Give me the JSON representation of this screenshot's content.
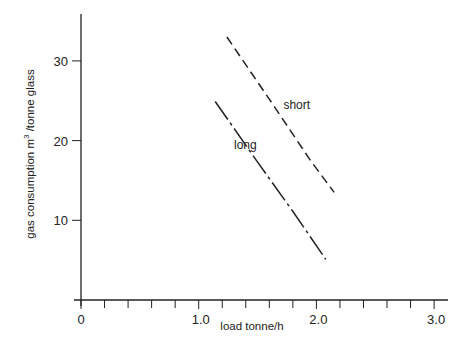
{
  "chart_data": {
    "type": "line",
    "title": "",
    "xlabel": "load  tonne/h",
    "ylabel": "gas consumption m³/tonne glass",
    "ylabel_main": "gas consumption m",
    "ylabel_sup": "3",
    "ylabel_rest": " /tonne glass",
    "xlim": [
      0,
      3.0
    ],
    "ylim": [
      0,
      35
    ],
    "x_ticks": [
      0,
      1.0,
      2.0,
      3.0
    ],
    "x_tick_labels": [
      "0",
      "1.0",
      "2.0",
      "3.0"
    ],
    "x_minor_tick_step": 0.2,
    "y_ticks": [
      10,
      20,
      30
    ],
    "y_tick_labels": [
      "10",
      "20",
      "30"
    ],
    "grid": false,
    "legend": "inline labels",
    "series": [
      {
        "name": "short",
        "style": "dashed",
        "x": [
          1.24,
          1.6,
          1.95,
          2.15
        ],
        "y": [
          33.0,
          25.2,
          17.5,
          13.5
        ]
      },
      {
        "name": "long",
        "style": "dash-dot",
        "x": [
          1.14,
          1.5,
          1.8,
          2.08
        ],
        "y": [
          24.9,
          17.3,
          11.1,
          5.1
        ]
      }
    ],
    "annotations": [
      {
        "text": "short",
        "x": 1.72,
        "y": 24.0
      },
      {
        "text": "long",
        "x": 1.3,
        "y": 19.0
      }
    ]
  }
}
